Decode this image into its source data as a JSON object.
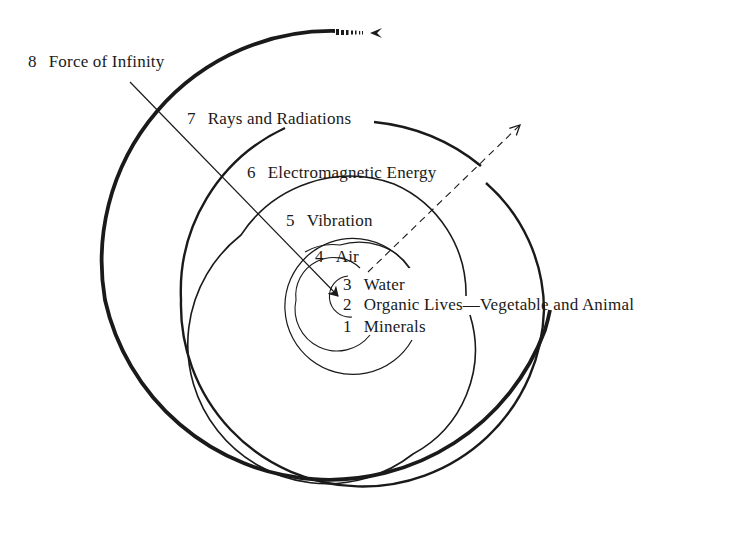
{
  "diagram": {
    "type": "spiral",
    "levels": [
      {
        "number": "1",
        "label": "Minerals"
      },
      {
        "number": "2",
        "label": "Organic Lives—Vegetable and Animal"
      },
      {
        "number": "3",
        "label": "Water"
      },
      {
        "number": "4",
        "label": "Air"
      },
      {
        "number": "5",
        "label": "Vibration"
      },
      {
        "number": "6",
        "label": "Electromagnetic Energy"
      },
      {
        "number": "7",
        "label": "Rays and Radiations"
      },
      {
        "number": "8",
        "label": "Force of Infinity"
      }
    ],
    "arrows": [
      {
        "name": "inward-arrow",
        "style": "solid",
        "from": "Force of Infinity",
        "to": "center"
      },
      {
        "name": "outward-arrow",
        "style": "dashed",
        "from": "center",
        "to": "outside"
      }
    ],
    "colors": {
      "line": "#1a1a1a",
      "background": "#ffffff"
    }
  }
}
